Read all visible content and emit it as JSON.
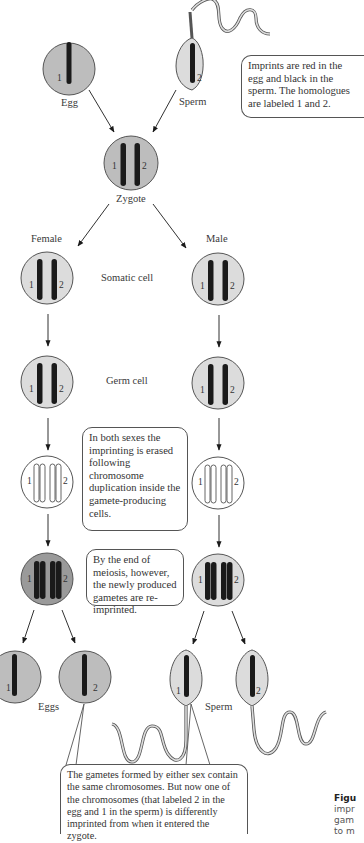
{
  "colors": {
    "cell_fill_imprinted": "#bdbdbd",
    "cell_fill_light": "#dcdcdc",
    "cell_fill_erased": "#ffffff",
    "chromosome": "#1a1a1a",
    "outline": "#555555",
    "text": "#333333"
  },
  "top": {
    "egg_label": "Egg",
    "sperm_label": "Sperm",
    "egg_homolog": "1",
    "sperm_homolog": "2",
    "note": "Imprints are red in the egg and black in the sperm.  The homologues are labeled 1 and 2."
  },
  "zygote": {
    "label": "Zygote",
    "homolog_left": "1",
    "homolog_right": "2"
  },
  "columns": {
    "female_label": "Female",
    "male_label": "Male"
  },
  "stages": {
    "somatic_label": "Somatic cell",
    "germ_label": "Germ cell"
  },
  "homologs": {
    "left": "1",
    "right": "2"
  },
  "notes": {
    "erased": "In both sexes the imprinting is erased following chromosome duplication inside the gamete-producing cells.",
    "reimprinted": "By the end of meiosis, however, the newly produced gametes are re-imprinted.",
    "bottom": "The gametes formed by either sex contain the same chromosomes.  But now one of the chromosomes (that labeled 2 in the egg and 1 in the sperm) is differently imprinted from when it entered the zygote."
  },
  "gametes": {
    "eggs_label": "Eggs",
    "sperm_label": "Sperm",
    "egg_homologs": [
      "1",
      "2"
    ],
    "sperm_homologs": [
      "1",
      "2"
    ]
  },
  "caption": {
    "lines": [
      "Figu",
      "impr",
      "gam",
      "to m"
    ]
  }
}
